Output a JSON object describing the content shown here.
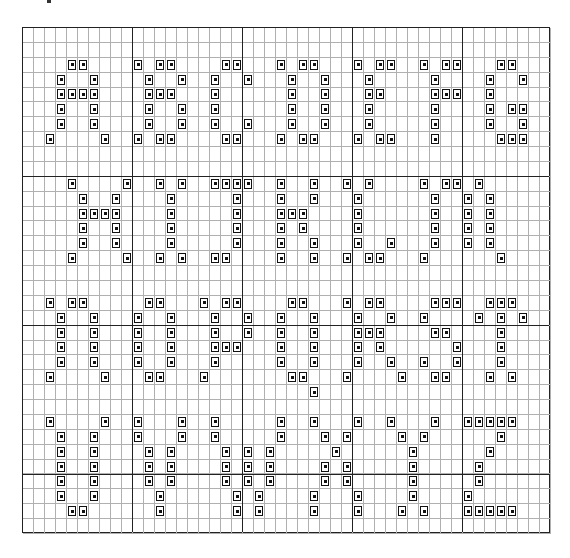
{
  "grid": {
    "cols": 48,
    "rows": 34,
    "cell_w": 11,
    "cell_h": 14.88,
    "thick_every": 10,
    "colors": {
      "line": "#b0b0b0",
      "thick": "#222222",
      "mark": "#111111"
    },
    "marks": {
      "2": [
        4,
        5,
        10,
        12,
        13,
        18,
        19,
        23,
        25,
        26,
        30,
        32,
        33,
        36,
        38,
        39,
        43,
        44
      ],
      "3": [
        3,
        6,
        11,
        14,
        17,
        20,
        24,
        27,
        31,
        37,
        42,
        45
      ],
      "4": [
        3,
        4,
        5,
        6,
        11,
        12,
        13,
        17,
        24,
        27,
        31,
        32,
        37,
        38,
        39,
        42
      ],
      "5": [
        3,
        6,
        11,
        14,
        17,
        24,
        27,
        31,
        37,
        42,
        44,
        45
      ],
      "6": [
        3,
        6,
        11,
        14,
        17,
        20,
        24,
        27,
        31,
        37,
        42,
        45
      ],
      "7": [
        2,
        7,
        10,
        12,
        13,
        18,
        19,
        23,
        25,
        26,
        30,
        32,
        33,
        37,
        43,
        44,
        45
      ],
      "10": [
        4,
        9,
        12,
        14,
        17,
        18,
        19,
        20,
        23,
        26,
        29,
        31,
        36,
        38,
        39,
        41
      ],
      "11": [
        5,
        8,
        13,
        19,
        23,
        26,
        30,
        37,
        40,
        42
      ],
      "12": [
        5,
        6,
        7,
        8,
        13,
        19,
        23,
        24,
        25,
        30,
        37,
        40,
        42
      ],
      "13": [
        5,
        8,
        13,
        19,
        23,
        25,
        30,
        37,
        40,
        42
      ],
      "14": [
        5,
        8,
        13,
        19,
        23,
        26,
        30,
        33,
        37,
        40,
        42
      ],
      "15": [
        4,
        9,
        12,
        14,
        17,
        18,
        23,
        26,
        29,
        31,
        32,
        36,
        43
      ],
      "18": [
        2,
        4,
        5,
        11,
        12,
        16,
        18,
        19,
        24,
        25,
        29,
        31,
        32,
        37,
        38,
        39,
        42,
        43,
        44
      ],
      "19": [
        3,
        6,
        10,
        13,
        17,
        20,
        23,
        26,
        30,
        33,
        36,
        41,
        43,
        45
      ],
      "20": [
        3,
        6,
        10,
        13,
        17,
        20,
        23,
        26,
        30,
        31,
        32,
        37,
        38,
        43
      ],
      "21": [
        3,
        6,
        10,
        13,
        17,
        18,
        19,
        23,
        26,
        30,
        32,
        39,
        43
      ],
      "22": [
        3,
        6,
        10,
        13,
        17,
        23,
        26,
        30,
        33,
        36,
        39,
        43
      ],
      "23": [
        2,
        7,
        11,
        12,
        16,
        24,
        25,
        29,
        34,
        37,
        38,
        42,
        44
      ],
      "24": [
        26
      ],
      "26": [
        2,
        7,
        10,
        14,
        17,
        23,
        26,
        30,
        33,
        37,
        40,
        41,
        42,
        43,
        44
      ],
      "27": [
        3,
        6,
        10,
        14,
        17,
        23,
        27,
        29,
        34,
        36,
        43
      ],
      "28": [
        3,
        6,
        11,
        13,
        18,
        20,
        22,
        28,
        35,
        42
      ],
      "29": [
        3,
        6,
        11,
        13,
        18,
        20,
        22,
        27,
        29,
        35,
        41
      ],
      "30": [
        3,
        6,
        11,
        13,
        18,
        20,
        22,
        27,
        29,
        35,
        41
      ],
      "31": [
        3,
        6,
        12,
        19,
        21,
        26,
        30,
        35,
        40
      ],
      "32": [
        4,
        5,
        12,
        19,
        21,
        26,
        30,
        34,
        36,
        40,
        41,
        42,
        43,
        44
      ]
    }
  }
}
